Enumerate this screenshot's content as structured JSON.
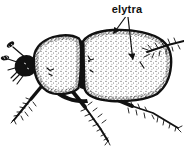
{
  "figure": {
    "annotation": {
      "label": "elytra",
      "arrow_count": 2
    },
    "colors": {
      "ink": "#111111",
      "background": "#ffffff"
    }
  }
}
